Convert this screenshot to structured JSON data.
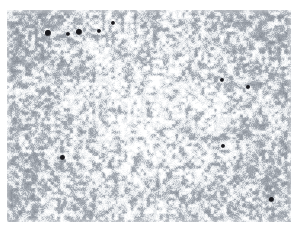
{
  "image": {
    "kind": "micrograph",
    "subject": "grayscale mottled stipple texture with dark particulate inclusions",
    "canvas_width": 298,
    "canvas_height": 236,
    "background_color": "#ffffff",
    "field": {
      "x": 7,
      "y": 10,
      "width": 284,
      "height": 212
    },
    "texture": {
      "pattern": "labyrinthine-mottle",
      "base_color": "#ffffff",
      "mid_tone": "#a8aeb6",
      "dark_tone": "#8a9099",
      "light_tone": "#e6e9ec",
      "feature_scale_px": 3.2,
      "coverage_fraction": 0.52,
      "edge_density_boost": 0.18,
      "center_lightening": 0.12,
      "grain_seed": 20250411
    },
    "particles": {
      "color": "#1a1a1f",
      "count": 10,
      "items": [
        {
          "id": "p1",
          "x": 48,
          "y": 33,
          "r": 2.6
        },
        {
          "id": "p2",
          "x": 68,
          "y": 34,
          "r": 2.4
        },
        {
          "id": "p3",
          "x": 79,
          "y": 32,
          "r": 2.8
        },
        {
          "id": "p4",
          "x": 99,
          "y": 31,
          "r": 2.3
        },
        {
          "id": "p5",
          "x": 113,
          "y": 23,
          "r": 1.9
        },
        {
          "id": "p6",
          "x": 222,
          "y": 80,
          "r": 2.4
        },
        {
          "id": "p7",
          "x": 248,
          "y": 87,
          "r": 2.3
        },
        {
          "id": "p8",
          "x": 62,
          "y": 157,
          "r": 2.5
        },
        {
          "id": "p9",
          "x": 223,
          "y": 146,
          "r": 2.4
        },
        {
          "id": "p10",
          "x": 271,
          "y": 199,
          "r": 2.5
        }
      ]
    }
  }
}
